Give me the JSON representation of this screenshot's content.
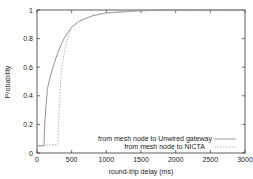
{
  "chart_data": {
    "type": "line",
    "title": "",
    "xlabel": "round-trip delay (ms)",
    "ylabel": "Probability",
    "xlim": [
      0,
      3000
    ],
    "ylim": [
      0,
      1
    ],
    "xticks": [
      "0",
      "500",
      "1000",
      "1500",
      "2000",
      "2500",
      "3000"
    ],
    "yticks": [
      "0",
      "0.2",
      "0.4",
      "0.6",
      "0.8",
      "1"
    ],
    "grid": false,
    "legend_position": "lower right",
    "series": [
      {
        "name": "from mesh node to Unwired gateway",
        "style": "solid",
        "x": [
          0,
          100,
          110,
          150,
          160,
          200,
          250,
          300,
          350,
          400,
          500,
          600,
          800,
          1000,
          1500,
          2000,
          2500,
          3000
        ],
        "y": [
          0.05,
          0.05,
          0.2,
          0.45,
          0.47,
          0.55,
          0.63,
          0.7,
          0.76,
          0.81,
          0.88,
          0.92,
          0.96,
          0.98,
          0.995,
          1.0,
          1.0,
          1.0
        ]
      },
      {
        "name": "from mesh node to NICTA",
        "style": "dashed",
        "x": [
          0,
          300,
          320,
          340,
          360,
          400,
          450,
          500,
          600,
          800,
          1000,
          1500,
          2000,
          2500,
          3000
        ],
        "y": [
          0.05,
          0.06,
          0.3,
          0.5,
          0.6,
          0.72,
          0.82,
          0.88,
          0.92,
          0.96,
          0.98,
          0.995,
          1.0,
          1.0,
          1.0
        ]
      }
    ]
  }
}
